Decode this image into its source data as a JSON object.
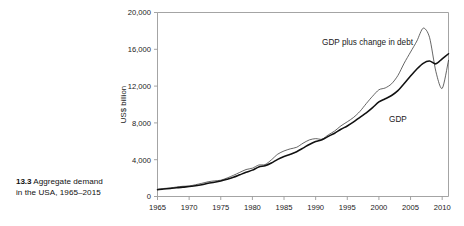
{
  "caption": {
    "figure_number": "13.3",
    "line1": "Aggregate demand",
    "line2": "in the USA, 1965–2015"
  },
  "chart_data": {
    "type": "line",
    "title": "",
    "xlabel": "",
    "ylabel": "US$ billion",
    "xlim": [
      1965,
      2011
    ],
    "ylim": [
      0,
      20000
    ],
    "grid": false,
    "legend": "inline-annotations",
    "xticks": [
      1965,
      1970,
      1975,
      1980,
      1985,
      1990,
      1995,
      2000,
      2005,
      2010
    ],
    "xtick_labels": [
      "1965",
      "1970",
      "1975",
      "1980",
      "1985",
      "1990",
      "1995",
      "2000",
      "2005",
      "2010"
    ],
    "yticks": [
      0,
      4000,
      8000,
      12000,
      16000,
      20000
    ],
    "ytick_labels": [
      "0",
      "4,000",
      "8,000",
      "12,000",
      "16,000",
      "20,000"
    ],
    "annotations": [
      {
        "text": "GDP plus change in debt",
        "x": 1998.2,
        "y": 16450
      },
      {
        "text": "GDP",
        "x": 2003.0,
        "y": 8150
      }
    ],
    "x": [
      1965,
      1966,
      1967,
      1968,
      1969,
      1970,
      1971,
      1972,
      1973,
      1974,
      1975,
      1976,
      1977,
      1978,
      1979,
      1980,
      1981,
      1982,
      1983,
      1984,
      1985,
      1986,
      1987,
      1988,
      1989,
      1990,
      1991,
      1992,
      1993,
      1994,
      1995,
      1996,
      1997,
      1998,
      1999,
      2000,
      2001,
      2002,
      2003,
      2004,
      2005,
      2006,
      2007,
      2008,
      2009,
      2010,
      2011
    ],
    "series": [
      {
        "name": "GDP",
        "values": [
          743,
          815,
          862,
          943,
          1020,
          1076,
          1168,
          1282,
          1429,
          1549,
          1689,
          1878,
          2086,
          2357,
          2632,
          2863,
          3211,
          3345,
          3638,
          4041,
          4347,
          4590,
          4870,
          5253,
          5658,
          5980,
          6174,
          6539,
          6879,
          7309,
          7664,
          8100,
          8609,
          9089,
          9661,
          10285,
          10622,
          10978,
          11511,
          12275,
          13094,
          13856,
          14478,
          14719,
          14419,
          14964,
          15518
        ]
      },
      {
        "name": "GDP plus change in debt",
        "values": [
          790,
          872,
          930,
          1030,
          1110,
          1140,
          1280,
          1430,
          1600,
          1700,
          1770,
          2010,
          2300,
          2620,
          2930,
          3080,
          3420,
          3470,
          3980,
          4600,
          4950,
          5180,
          5350,
          5790,
          6150,
          6290,
          6230,
          6700,
          7120,
          7680,
          8120,
          8600,
          9250,
          10100,
          10900,
          11600,
          11800,
          12250,
          13150,
          14500,
          15700,
          16900,
          18300,
          17300,
          13600,
          11750,
          14800
        ]
      }
    ]
  }
}
